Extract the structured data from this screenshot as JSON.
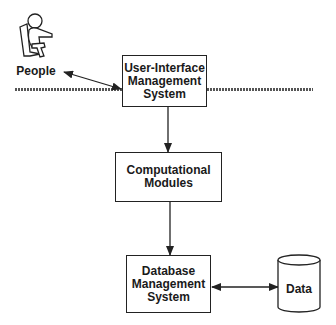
{
  "diagram": {
    "nodes": {
      "people": {
        "label": "People",
        "icon": "person-in-chair-icon"
      },
      "uims": {
        "lines": [
          "User-Interface",
          "Management",
          "System"
        ]
      },
      "computational": {
        "lines": [
          "Computational",
          "Modules"
        ]
      },
      "dbms": {
        "lines": [
          "Database",
          "Management",
          "System"
        ]
      },
      "data": {
        "label": "Data",
        "icon": "database-cylinder-icon"
      }
    },
    "edges": [
      {
        "from": "people",
        "to": "uims",
        "type": "bidirectional"
      },
      {
        "from": "uims",
        "to": "computational",
        "type": "directed"
      },
      {
        "from": "computational",
        "to": "dbms",
        "type": "directed"
      },
      {
        "from": "dbms",
        "to": "data",
        "type": "bidirectional"
      }
    ],
    "boundary": {
      "type": "hatched-horizontal-line"
    },
    "colors": {
      "stroke": "#222222",
      "background": "#ffffff"
    }
  }
}
